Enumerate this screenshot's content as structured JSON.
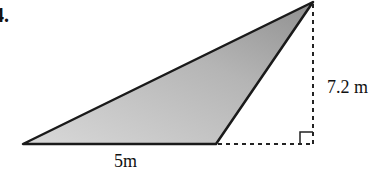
{
  "problem": {
    "number": "4."
  },
  "figure": {
    "type": "obtuse triangle with external height",
    "base_label": "5m",
    "height_label": "7.2 m",
    "fill_color": "#b8b8b8",
    "stroke_color": "#1a1a1a"
  }
}
